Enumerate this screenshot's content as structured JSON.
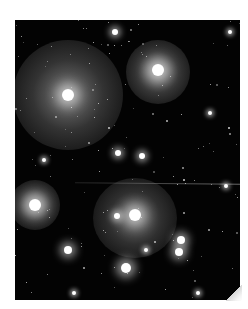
{
  "image": {
    "subject": "star field with reflection nebulae",
    "palette": {
      "background": "#ffffff",
      "sky": "#030303",
      "nebula": "#bdbdbd",
      "star": "#ffffff"
    }
  },
  "nebulae": [
    {
      "cx": 68,
      "cy": 95,
      "rx": 55,
      "ry": 55,
      "opacity": 0.55
    },
    {
      "cx": 158,
      "cy": 72,
      "rx": 32,
      "ry": 32,
      "opacity": 0.6
    },
    {
      "cx": 35,
      "cy": 205,
      "rx": 25,
      "ry": 25,
      "opacity": 0.55
    },
    {
      "cx": 135,
      "cy": 218,
      "rx": 42,
      "ry": 40,
      "opacity": 0.5
    }
  ],
  "bright_stars": [
    {
      "x": 68,
      "y": 95,
      "r": 6
    },
    {
      "x": 158,
      "y": 70,
      "r": 6
    },
    {
      "x": 115,
      "y": 32,
      "r": 3
    },
    {
      "x": 35,
      "y": 205,
      "r": 6
    },
    {
      "x": 135,
      "y": 215,
      "r": 6
    },
    {
      "x": 117,
      "y": 216,
      "r": 3
    },
    {
      "x": 181,
      "y": 240,
      "r": 4
    },
    {
      "x": 179,
      "y": 252,
      "r": 4
    },
    {
      "x": 126,
      "y": 268,
      "r": 5
    },
    {
      "x": 68,
      "y": 250,
      "r": 4
    },
    {
      "x": 118,
      "y": 153,
      "r": 3
    },
    {
      "x": 142,
      "y": 156,
      "r": 3
    },
    {
      "x": 44,
      "y": 160,
      "r": 2
    },
    {
      "x": 146,
      "y": 250,
      "r": 2
    },
    {
      "x": 230,
      "y": 32,
      "r": 2
    },
    {
      "x": 226,
      "y": 186,
      "r": 2
    },
    {
      "x": 210,
      "y": 113,
      "r": 2
    },
    {
      "x": 74,
      "y": 293,
      "r": 2
    },
    {
      "x": 198,
      "y": 293,
      "r": 2
    }
  ]
}
